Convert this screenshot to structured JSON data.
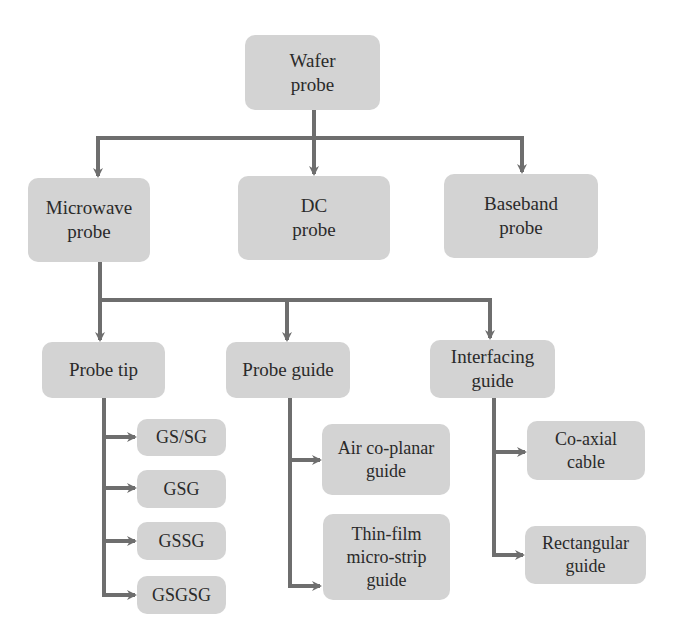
{
  "diagram": {
    "type": "hierarchy",
    "root": {
      "id": "wafer",
      "lines": [
        "Wafer",
        "probe"
      ]
    },
    "level1": [
      {
        "id": "microwave",
        "lines": [
          "Microwave",
          "probe"
        ]
      },
      {
        "id": "dc",
        "lines": [
          "DC",
          "probe"
        ]
      },
      {
        "id": "baseband",
        "lines": [
          "Baseband",
          "probe"
        ]
      }
    ],
    "level2": [
      {
        "id": "probe-tip",
        "lines": [
          "Probe tip"
        ],
        "children": [
          {
            "id": "gs-sg",
            "lines": [
              "GS/SG"
            ]
          },
          {
            "id": "gsg",
            "lines": [
              "GSG"
            ]
          },
          {
            "id": "gssg",
            "lines": [
              "GSSG"
            ]
          },
          {
            "id": "gsgsg",
            "lines": [
              "GSGSG"
            ]
          }
        ]
      },
      {
        "id": "probe-guide",
        "lines": [
          "Probe guide"
        ],
        "children": [
          {
            "id": "air-coplanar",
            "lines": [
              "Air co-planar",
              "guide"
            ]
          },
          {
            "id": "thin-film",
            "lines": [
              "Thin-film",
              "micro-strip",
              "guide"
            ]
          }
        ]
      },
      {
        "id": "interfacing-guide",
        "lines": [
          "Interfacing",
          "guide"
        ],
        "children": [
          {
            "id": "co-axial",
            "lines": [
              "Co-axial",
              "cable"
            ]
          },
          {
            "id": "rectangular",
            "lines": [
              "Rectangular",
              "guide"
            ]
          }
        ]
      }
    ],
    "colors": {
      "box_fill": "#d3d3d3",
      "connector": "#6e6e6e",
      "text": "#2a2a2a"
    }
  }
}
